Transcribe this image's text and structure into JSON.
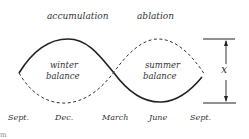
{
  "diagram": {
    "phase_labels": {
      "accumulation": "accumulation",
      "ablation": "ablation"
    },
    "area_labels": {
      "winter_line1": "winter",
      "winter_line2": "balance",
      "summer_line1": "summer",
      "summer_line2": "balance"
    },
    "amplitude_label": "x",
    "months": [
      "Sept.",
      "Dec.",
      "March",
      "June",
      "Sept."
    ],
    "corner_fragment": "m",
    "colors": {
      "line": "#222222",
      "text": "#333333",
      "background": "#ffffff"
    },
    "series": [
      {
        "name": "solid-curve",
        "style": "solid",
        "shape": "rises from Sept. to peak at Dec., crosses at March, trough at June, rises to Sept."
      },
      {
        "name": "dashed-curve",
        "style": "dashed",
        "shape": "falls from Sept. to trough at Dec., crosses at March, peak at June, falls to Sept."
      }
    ]
  }
}
